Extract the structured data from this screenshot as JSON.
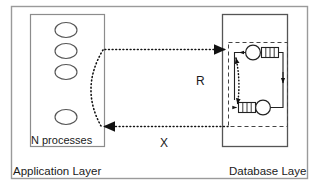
{
  "figure": {
    "type": "architecture-diagram",
    "width": 319,
    "height": 188,
    "background": "#ffffff",
    "stroke": "#1a1a1a"
  },
  "layers": {
    "application": {
      "label": "Application Layer",
      "inner_label": "N processes",
      "process_count": 4,
      "process_shape": "ellipse",
      "box": {
        "x": 30,
        "y": 14,
        "w": 75,
        "h": 133
      }
    },
    "database": {
      "label": "Database Laye",
      "box": {
        "x": 222,
        "y": 14,
        "w": 66,
        "h": 133
      },
      "cycle_box": {
        "x": 228,
        "y": 42,
        "w": 60,
        "h": 85
      },
      "cycle_box_style": "dashed",
      "nodes": [
        {
          "id": "txn-top",
          "shape": "circle",
          "cx": 253,
          "cy": 52
        },
        {
          "id": "resource-top",
          "shape": "striped-rectangle",
          "x": 262,
          "y": 47,
          "w": 18,
          "h": 11
        },
        {
          "id": "resource-bottom",
          "shape": "striped-rectangle",
          "x": 238,
          "y": 102,
          "w": 18,
          "h": 11
        },
        {
          "id": "txn-bottom",
          "shape": "circle",
          "cx": 264,
          "cy": 108
        }
      ]
    }
  },
  "edges": [
    {
      "id": "request",
      "label": "R",
      "style": "dotted",
      "direction": "application-to-database",
      "arrowhead": "solid-triangle"
    },
    {
      "id": "response",
      "label": "X",
      "style": "dotted",
      "direction": "database-to-application",
      "arrowhead": "solid-triangle"
    }
  ],
  "icon_names": {
    "process": "ellipse-process-icon",
    "transaction": "circle-transaction-icon",
    "resource": "striped-resource-icon",
    "wait_for": "dotted-wait-arrow-icon",
    "hold": "solid-hold-arrow-icon"
  }
}
